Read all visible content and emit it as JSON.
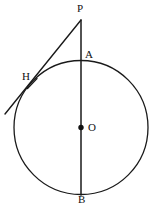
{
  "figure": {
    "background_color": "#ffffff",
    "stroke_color": "#1a1a1a",
    "width": 156,
    "height": 210
  },
  "labels": {
    "P": "P",
    "A": "A",
    "H": "H",
    "O": "O",
    "B": "B"
  },
  "geometry": {
    "circle": {
      "cx": 81,
      "cy": 127.5,
      "r": 67
    },
    "points": {
      "P": {
        "x": 81,
        "y": 20
      },
      "A": {
        "x": 81,
        "y": 60.5
      },
      "O": {
        "x": 81,
        "y": 127.5
      },
      "B": {
        "x": 81,
        "y": 194.5
      },
      "H": {
        "x": 32,
        "y": 83
      }
    },
    "segments": {
      "diameter_PB": {
        "x1": 81,
        "y1": 20,
        "x2": 81,
        "y2": 195
      },
      "tangent_line": {
        "x1": 81,
        "y1": 20,
        "x2": 5,
        "y2": 114
      },
      "tangent_tick": {
        "x1": 28,
        "y1": 88,
        "x2": 37,
        "y2": 79
      }
    },
    "center_dot_radius": 2.6
  }
}
